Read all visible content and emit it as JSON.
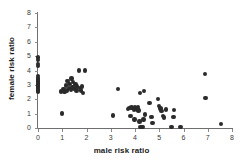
{
  "chart_data": {
    "type": "scatter",
    "title": "",
    "xlabel": "male risk ratio",
    "ylabel": "female risk ratio",
    "xlim": [
      0,
      8
    ],
    "ylim": [
      0,
      8
    ],
    "xticks": [
      0,
      1,
      2,
      3,
      4,
      5,
      6,
      7,
      8
    ],
    "yticks": [
      0,
      1,
      2,
      3,
      4,
      5,
      6,
      7,
      8
    ],
    "xtick_labels": [
      "0",
      "1",
      "2",
      "3",
      "4",
      "5",
      "6",
      "7",
      "8"
    ],
    "ytick_labels": [
      "0",
      "1",
      "2",
      "3",
      "4",
      "5",
      "6",
      "7",
      "8"
    ],
    "grid": false,
    "legend": null,
    "marker_color": "#2b2b2b",
    "marker_size": 4.4,
    "series": [
      {
        "name": "studies",
        "points": [
          [
            0.0,
            4.9
          ],
          [
            0.0,
            4.75
          ],
          [
            0.0,
            4.45
          ],
          [
            0.0,
            4.3
          ],
          [
            0.0,
            3.6
          ],
          [
            0.0,
            3.5
          ],
          [
            0.0,
            3.42
          ],
          [
            0.0,
            3.34
          ],
          [
            0.0,
            3.26
          ],
          [
            0.0,
            3.18
          ],
          [
            0.0,
            3.1
          ],
          [
            0.0,
            3.02
          ],
          [
            0.0,
            2.94
          ],
          [
            0.0,
            2.86
          ],
          [
            0.0,
            2.78
          ],
          [
            0.0,
            2.7
          ],
          [
            0.0,
            2.62
          ],
          [
            0.0,
            2.54
          ],
          [
            1.0,
            1.0
          ],
          [
            0.95,
            2.55
          ],
          [
            1.05,
            2.72
          ],
          [
            1.1,
            2.5
          ],
          [
            1.15,
            2.95
          ],
          [
            1.2,
            2.62
          ],
          [
            1.22,
            3.25
          ],
          [
            1.28,
            2.78
          ],
          [
            1.3,
            3.05
          ],
          [
            1.35,
            2.68
          ],
          [
            1.38,
            3.45
          ],
          [
            1.42,
            2.85
          ],
          [
            1.45,
            3.18
          ],
          [
            1.5,
            2.72
          ],
          [
            1.55,
            3.02
          ],
          [
            1.58,
            2.6
          ],
          [
            1.62,
            2.9
          ],
          [
            1.7,
            4.0
          ],
          [
            1.72,
            2.78
          ],
          [
            1.78,
            2.62
          ],
          [
            1.82,
            2.88
          ],
          [
            1.95,
            4.0
          ],
          [
            1.85,
            2.45
          ],
          [
            3.1,
            0.88
          ],
          [
            3.3,
            2.72
          ],
          [
            3.72,
            1.32
          ],
          [
            3.78,
            1.38
          ],
          [
            3.82,
            0.82
          ],
          [
            3.85,
            1.42
          ],
          [
            3.95,
            1.28
          ],
          [
            3.98,
            0.6
          ],
          [
            4.0,
            1.45
          ],
          [
            4.05,
            1.35
          ],
          [
            4.1,
            1.3
          ],
          [
            4.12,
            1.48
          ],
          [
            4.15,
            1.22
          ],
          [
            4.18,
            0.45
          ],
          [
            4.2,
            2.45
          ],
          [
            4.22,
            0.05
          ],
          [
            4.28,
            0.05
          ],
          [
            4.32,
            0.05
          ],
          [
            4.35,
            0.58
          ],
          [
            4.38,
            2.58
          ],
          [
            4.42,
            0.95
          ],
          [
            4.6,
            1.72
          ],
          [
            4.68,
            0.78
          ],
          [
            4.72,
            0.35
          ],
          [
            4.95,
            2.0
          ],
          [
            5.0,
            1.52
          ],
          [
            5.05,
            1.35
          ],
          [
            5.1,
            1.18
          ],
          [
            5.15,
            0.82
          ],
          [
            5.2,
            0.72
          ],
          [
            5.28,
            1.28
          ],
          [
            5.5,
            0.05
          ],
          [
            5.58,
            0.78
          ],
          [
            5.62,
            1.25
          ],
          [
            5.88,
            0.05
          ],
          [
            6.88,
            3.75
          ],
          [
            6.9,
            2.08
          ],
          [
            7.55,
            0.3
          ]
        ]
      }
    ]
  }
}
